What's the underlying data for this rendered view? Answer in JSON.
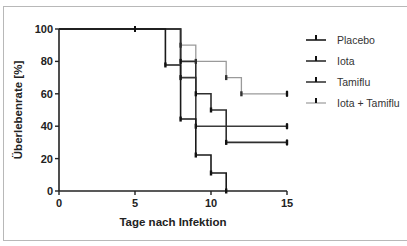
{
  "chart_data": {
    "type": "line",
    "subtype": "kaplan-meier-step",
    "title": "",
    "xlabel": "Tage nach Infektion",
    "ylabel": "Überlebenrate [%]",
    "xlim": [
      0,
      15
    ],
    "ylim": [
      0,
      100
    ],
    "xticks": [
      0,
      5,
      10,
      15
    ],
    "yticks": [
      0,
      20,
      40,
      60,
      80,
      100
    ],
    "grid": false,
    "legend_position": "right",
    "series": [
      {
        "name": "Placebo",
        "color": "#1a1a1a",
        "steps": [
          [
            0,
            100
          ],
          [
            7,
            77.8
          ],
          [
            8,
            44.4
          ],
          [
            9,
            22.2
          ],
          [
            10,
            11.1
          ],
          [
            11,
            0
          ]
        ],
        "censored": [
          [
            5,
            100
          ]
        ]
      },
      {
        "name": "Iota",
        "color": "#2e2e2e",
        "steps": [
          [
            0,
            100
          ],
          [
            8,
            80
          ],
          [
            9,
            60
          ],
          [
            10,
            50
          ],
          [
            11,
            30
          ],
          [
            15,
            30
          ]
        ],
        "censored": [
          [
            15,
            30
          ]
        ]
      },
      {
        "name": "Tamiflu",
        "color": "#3a3a3a",
        "steps": [
          [
            0,
            100
          ],
          [
            8,
            70
          ],
          [
            9,
            40
          ],
          [
            15,
            40
          ]
        ],
        "censored": [
          [
            15,
            40
          ]
        ]
      },
      {
        "name": "Iota + Tamiflu",
        "color": "#9a9a9a",
        "steps": [
          [
            0,
            100
          ],
          [
            8,
            90
          ],
          [
            9,
            80
          ],
          [
            11,
            70
          ],
          [
            12,
            60
          ],
          [
            15,
            60
          ]
        ],
        "censored": [
          [
            15,
            60
          ]
        ]
      }
    ]
  },
  "axes": {
    "x_title": "Tage nach Infektion",
    "y_title": "Überlebenrate [%]",
    "x_tick_labels": [
      "0",
      "5",
      "10",
      "15"
    ],
    "y_tick_labels": [
      "0",
      "20",
      "40",
      "60",
      "80",
      "100"
    ]
  },
  "legend": {
    "items": [
      {
        "label": "Placebo",
        "color": "#1a1a1a"
      },
      {
        "label": "Iota",
        "color": "#2e2e2e"
      },
      {
        "label": "Tamiflu",
        "color": "#3a3a3a"
      },
      {
        "label": "Iota + Tamiflu",
        "color": "#9a9a9a"
      }
    ]
  }
}
